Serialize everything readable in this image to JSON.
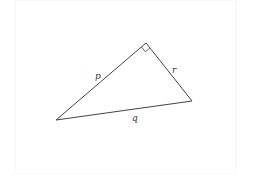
{
  "diagram": {
    "type": "right-triangle",
    "vertices": {
      "left": {
        "x": 56,
        "y": 120
      },
      "apex": {
        "x": 146,
        "y": 43
      },
      "right": {
        "x": 192,
        "y": 101
      }
    },
    "right_angle_at": "apex",
    "sides": {
      "p": {
        "label": "p",
        "from": "left",
        "to": "apex"
      },
      "r": {
        "label": "r",
        "from": "apex",
        "to": "right"
      },
      "q": {
        "label": "q",
        "from": "left",
        "to": "right"
      }
    },
    "colors": {
      "stroke": "#444444",
      "background": "#ffffff"
    }
  }
}
